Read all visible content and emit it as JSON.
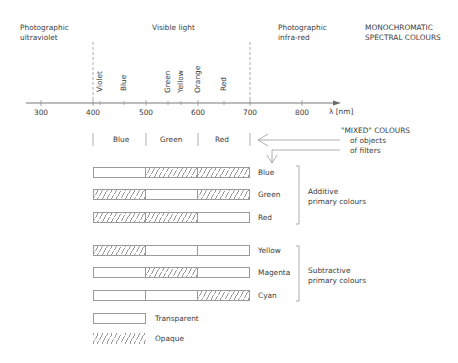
{
  "regions": {
    "uv": [
      "Photographic",
      "ultraviolet"
    ],
    "visible": "Visible light",
    "ir": [
      "Photographic",
      "infra-red"
    ],
    "mono": [
      "MONOCHROMATIC",
      "SPECTRAL COLOURS"
    ]
  },
  "axis": {
    "label": "λ [nm]",
    "ticks": [
      "300",
      "400",
      "500",
      "600",
      "700",
      "800"
    ],
    "visible_range_nm": [
      400,
      700
    ]
  },
  "spectral_labels": [
    "Violet",
    "Blue",
    "Green",
    "Yellow",
    "Orange",
    "Red"
  ],
  "bands": [
    "Blue",
    "Green",
    "Red"
  ],
  "mixed": {
    "title": "\"MIXED\" COLOURS",
    "lines": [
      "of objects",
      "of filters"
    ]
  },
  "additive": {
    "label": [
      "Additive",
      "primary colours"
    ],
    "rows": [
      {
        "name": "Blue",
        "pattern": [
          "transparent",
          "opaque",
          "opaque"
        ]
      },
      {
        "name": "Green",
        "pattern": [
          "opaque",
          "transparent",
          "opaque"
        ]
      },
      {
        "name": "Red",
        "pattern": [
          "opaque",
          "opaque",
          "transparent"
        ]
      }
    ]
  },
  "subtractive": {
    "label": [
      "Subtractive",
      "primary colours"
    ],
    "rows": [
      {
        "name": "Yellow",
        "pattern": [
          "opaque",
          "transparent",
          "transparent"
        ]
      },
      {
        "name": "Magenta",
        "pattern": [
          "transparent",
          "opaque",
          "transparent"
        ]
      },
      {
        "name": "Cyan",
        "pattern": [
          "transparent",
          "transparent",
          "opaque"
        ]
      }
    ]
  },
  "legend": {
    "transparent": "Transparent",
    "opaque": "Opaque"
  },
  "colors": {
    "line": "#9a9a9a",
    "text": "#3c3c3c",
    "background": "#ffffff"
  }
}
